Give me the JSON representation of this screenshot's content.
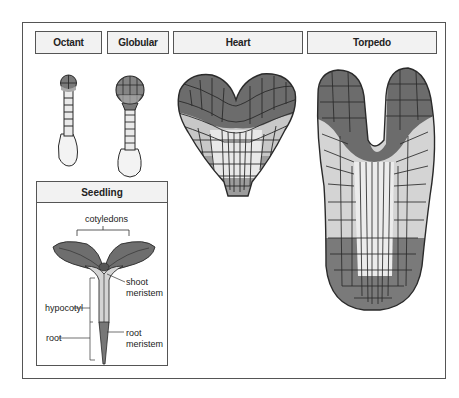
{
  "figure": {
    "stages": [
      {
        "id": "octant",
        "label": "Octant"
      },
      {
        "id": "globular",
        "label": "Globular"
      },
      {
        "id": "heart",
        "label": "Heart"
      },
      {
        "id": "torpedo",
        "label": "Torpedo"
      }
    ],
    "seedling": {
      "title": "Seedling",
      "labels": {
        "cotyledons": "cotyledons",
        "shoot_meristem_1": "shoot",
        "shoot_meristem_2": "meristem",
        "hypocotyl": "hypocotyl",
        "root": "root",
        "root_meristem_1": "root",
        "root_meristem_2": "meristem"
      }
    },
    "colors": {
      "dark_cells": "#6e6e6e",
      "mid_cells": "#9a9a9a",
      "light_cells": "#d9d9d9",
      "outline": "#2a2a2a",
      "label_bg": "#f2f2f2"
    }
  }
}
